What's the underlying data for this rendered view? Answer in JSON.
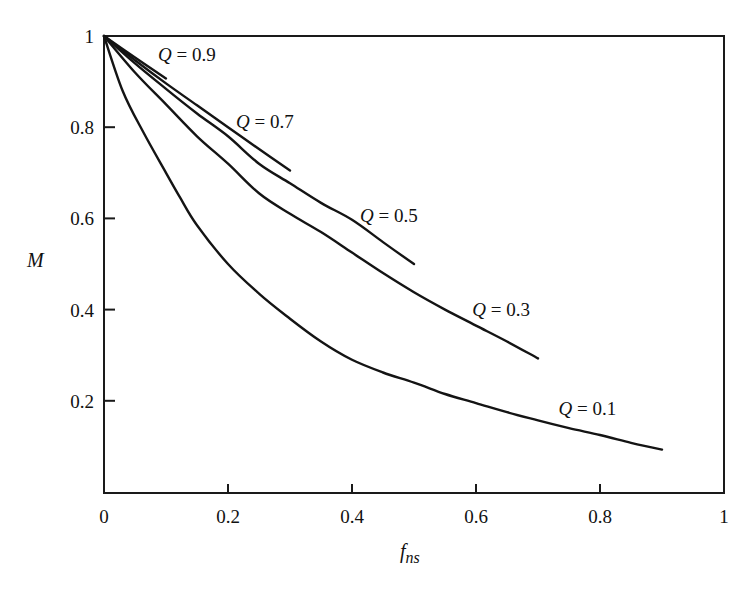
{
  "chart_data": {
    "type": "line",
    "title": "",
    "xlabel": "f_ns",
    "xlabel_main": "f",
    "xlabel_sub": "ns",
    "ylabel": "M",
    "xlim": [
      0,
      1
    ],
    "ylim": [
      0,
      1
    ],
    "grid": false,
    "legend": "none (curves labeled inline)",
    "x_ticks": [
      {
        "value": 0,
        "label": "0"
      },
      {
        "value": 0.2,
        "label": "0.2"
      },
      {
        "value": 0.4,
        "label": "0.4"
      },
      {
        "value": 0.6,
        "label": "0.6"
      },
      {
        "value": 0.8,
        "label": "0.8"
      },
      {
        "value": 1,
        "label": "1"
      }
    ],
    "y_ticks": [
      {
        "value": 0.2,
        "label": "0.2"
      },
      {
        "value": 0.4,
        "label": "0.4"
      },
      {
        "value": 0.6,
        "label": "0.6"
      },
      {
        "value": 0.8,
        "label": "0.8"
      },
      {
        "value": 1,
        "label": "1"
      }
    ],
    "series": [
      {
        "name": "Q = 0.9",
        "q_symbol": "Q",
        "q_value": "= 0.9",
        "label_pos": [
          0.087,
          0.945
        ],
        "points": [
          [
            0,
            1
          ],
          [
            0.05,
            0.953
          ],
          [
            0.1,
            0.907
          ]
        ]
      },
      {
        "name": "Q = 0.7",
        "q_symbol": "Q",
        "q_value": "= 0.7",
        "label_pos": [
          0.213,
          0.798
        ],
        "points": [
          [
            0,
            1
          ],
          [
            0.05,
            0.947
          ],
          [
            0.1,
            0.896
          ],
          [
            0.15,
            0.848
          ],
          [
            0.2,
            0.8
          ],
          [
            0.25,
            0.752
          ],
          [
            0.3,
            0.705
          ]
        ]
      },
      {
        "name": "Q = 0.5",
        "q_symbol": "Q",
        "q_value": "= 0.5",
        "label_pos": [
          0.413,
          0.593
        ],
        "points": [
          [
            0,
            1
          ],
          [
            0.05,
            0.94
          ],
          [
            0.1,
            0.884
          ],
          [
            0.15,
            0.83
          ],
          [
            0.2,
            0.78
          ],
          [
            0.25,
            0.72
          ],
          [
            0.3,
            0.677
          ],
          [
            0.35,
            0.634
          ],
          [
            0.4,
            0.597
          ],
          [
            0.45,
            0.548
          ],
          [
            0.5,
            0.5
          ]
        ]
      },
      {
        "name": "Q = 0.3",
        "q_symbol": "Q",
        "q_value": "= 0.3",
        "label_pos": [
          0.594,
          0.385
        ],
        "points": [
          [
            0,
            1
          ],
          [
            0.05,
            0.92
          ],
          [
            0.1,
            0.85
          ],
          [
            0.15,
            0.78
          ],
          [
            0.2,
            0.72
          ],
          [
            0.25,
            0.655
          ],
          [
            0.3,
            0.61
          ],
          [
            0.35,
            0.57
          ],
          [
            0.4,
            0.525
          ],
          [
            0.45,
            0.48
          ],
          [
            0.5,
            0.438
          ],
          [
            0.55,
            0.4
          ],
          [
            0.6,
            0.365
          ],
          [
            0.65,
            0.33
          ],
          [
            0.7,
            0.293
          ]
        ]
      },
      {
        "name": "Q = 0.1",
        "q_symbol": "Q",
        "q_value": "= 0.1",
        "label_pos": [
          0.733,
          0.169
        ],
        "points": [
          [
            0,
            1
          ],
          [
            0.03,
            0.88
          ],
          [
            0.063,
            0.79
          ],
          [
            0.1,
            0.7
          ],
          [
            0.123,
            0.645
          ],
          [
            0.15,
            0.585
          ],
          [
            0.2,
            0.5
          ],
          [
            0.25,
            0.435
          ],
          [
            0.3,
            0.38
          ],
          [
            0.35,
            0.33
          ],
          [
            0.4,
            0.29
          ],
          [
            0.45,
            0.262
          ],
          [
            0.5,
            0.24
          ],
          [
            0.55,
            0.215
          ],
          [
            0.6,
            0.195
          ],
          [
            0.65,
            0.175
          ],
          [
            0.7,
            0.157
          ],
          [
            0.75,
            0.14
          ],
          [
            0.8,
            0.125
          ],
          [
            0.85,
            0.108
          ],
          [
            0.9,
            0.093
          ]
        ]
      }
    ]
  },
  "style": {
    "line_color": "#141414",
    "axis_color": "#1a1a1a",
    "background": "#ffffff"
  }
}
